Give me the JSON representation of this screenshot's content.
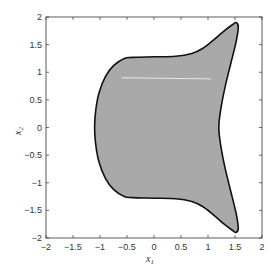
{
  "chart_data": {
    "type": "area",
    "title": "",
    "xlabel": "x",
    "xlabel_sub": "1",
    "ylabel": "x",
    "ylabel_sub": "2",
    "xlim": [
      -2,
      2
    ],
    "ylim": [
      -2,
      2
    ],
    "grid": false,
    "xticks": [
      -2,
      -1.5,
      -1,
      -0.5,
      0,
      0.5,
      1,
      1.5,
      2
    ],
    "yticks": [
      -2,
      -1.5,
      -1,
      -0.5,
      0,
      0.5,
      1,
      1.5,
      2
    ],
    "xtick_labels": [
      "-2",
      "-1.5",
      "-1",
      "-0.5",
      "0",
      "0.5",
      "1",
      "1.5",
      "2"
    ],
    "ytick_labels": [
      "-2",
      "-1.5",
      "-1",
      "-0.5",
      "0",
      "0.5",
      "1",
      "1.5",
      "2"
    ],
    "region": {
      "fill": "#a9a9a9",
      "stroke": "#111111",
      "boundary": [
        [
          1.52,
          1.9
        ],
        [
          1.45,
          1.86
        ],
        [
          1.3,
          1.75
        ],
        [
          1.1,
          1.58
        ],
        [
          0.9,
          1.43
        ],
        [
          0.7,
          1.34
        ],
        [
          0.4,
          1.29
        ],
        [
          0.0,
          1.28
        ],
        [
          -0.4,
          1.27
        ],
        [
          -0.55,
          1.25
        ],
        [
          -0.75,
          1.12
        ],
        [
          -0.9,
          0.92
        ],
        [
          -1.02,
          0.62
        ],
        [
          -1.08,
          0.3
        ],
        [
          -1.1,
          0.0
        ],
        [
          -1.08,
          -0.3
        ],
        [
          -1.02,
          -0.62
        ],
        [
          -0.9,
          -0.92
        ],
        [
          -0.75,
          -1.12
        ],
        [
          -0.55,
          -1.25
        ],
        [
          -0.4,
          -1.27
        ],
        [
          0.0,
          -1.28
        ],
        [
          0.4,
          -1.29
        ],
        [
          0.7,
          -1.34
        ],
        [
          0.9,
          -1.43
        ],
        [
          1.1,
          -1.58
        ],
        [
          1.3,
          -1.75
        ],
        [
          1.45,
          -1.86
        ],
        [
          1.52,
          -1.9
        ],
        [
          1.56,
          -1.82
        ],
        [
          1.52,
          -1.55
        ],
        [
          1.42,
          -1.15
        ],
        [
          1.32,
          -0.75
        ],
        [
          1.24,
          -0.35
        ],
        [
          1.2,
          0.0
        ],
        [
          1.24,
          0.35
        ],
        [
          1.32,
          0.75
        ],
        [
          1.42,
          1.15
        ],
        [
          1.52,
          1.55
        ],
        [
          1.56,
          1.82
        ]
      ]
    },
    "annotations": [
      {
        "type": "line",
        "color": "#e8e8e8",
        "from": [
          -0.6,
          0.9
        ],
        "to": [
          1.05,
          0.88
        ]
      }
    ]
  }
}
